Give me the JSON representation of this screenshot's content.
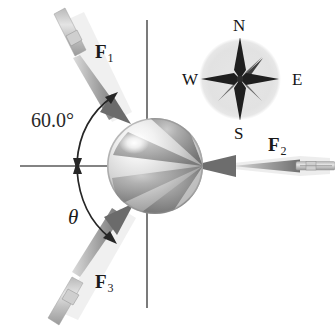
{
  "figure": {
    "background_color": "#ffffff",
    "axis_color": "#555555",
    "ink_color": "#1a1a1a"
  },
  "axes": {
    "horizontal_label": "horizontal-axis-line",
    "vertical_label": "vertical-axis-line"
  },
  "ball": {
    "name": "beach-ball",
    "center_x": 155,
    "center_y": 166,
    "radius": 48,
    "light_gore_color": "#e8e8e8",
    "dark_gore_color": "#8d8d8d",
    "highlight_color": "#ffffff"
  },
  "forces": [
    {
      "id": "F1",
      "label": "F",
      "subscript": "1",
      "direction": "down-right toward ball from upper-left",
      "angle_from_horizontal_deg": 60.0,
      "label_x": 95,
      "label_y": 42
    },
    {
      "id": "F2",
      "label": "F",
      "subscript": "2",
      "direction": "leftward toward ball from right",
      "angle_from_horizontal_deg": 0,
      "label_x": 268,
      "label_y": 135
    },
    {
      "id": "F3",
      "label": "F",
      "subscript": "3",
      "direction": "up-right toward ball from lower-left",
      "angle_from_horizontal_deg": -30,
      "label_x": 95,
      "label_y": 272
    }
  ],
  "angles": [
    {
      "id": "angle-60",
      "text": "60.0°",
      "label_x": 31,
      "label_y": 110,
      "description": "angle between F1 line of action and horizontal axis, above axis"
    },
    {
      "id": "angle-theta",
      "text": "θ",
      "label_x": 68,
      "label_y": 207,
      "description": "unknown angle between horizontal axis and F3 line of action, below axis"
    }
  ],
  "compass": {
    "name": "compass-rose",
    "center_x": 240,
    "center_y": 79,
    "radius": 41,
    "disc_color": "#e2e2e2",
    "star_color": "#2a2a2a",
    "labels": [
      {
        "id": "N",
        "text": "N",
        "x": 239,
        "y": 25
      },
      {
        "id": "E",
        "text": "E",
        "x": 297,
        "y": 80
      },
      {
        "id": "S",
        "text": "S",
        "x": 239,
        "y": 134
      },
      {
        "id": "W",
        "text": "W",
        "x": 192,
        "y": 80
      }
    ]
  }
}
